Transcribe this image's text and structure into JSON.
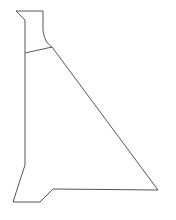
{
  "figure": {
    "background_color": "#ffffff",
    "stroke_color": "#555555",
    "fill_color": "#ffffff",
    "stroke_width": 1,
    "canvas": {
      "width": 176,
      "height": 220
    }
  },
  "geometry": {
    "outline_points": [
      {
        "name": "top-left-chamfer-start",
        "x": 16,
        "y": 11
      },
      {
        "name": "top-right-neck",
        "x": 43,
        "y": 11
      },
      {
        "name": "neck-right-straight-end",
        "x": 43,
        "y": 30
      },
      {
        "name": "shoulder-curve-control",
        "x": 45,
        "y": 41
      },
      {
        "name": "shoulder-junction",
        "x": 52,
        "y": 47
      },
      {
        "name": "bottom-right-vertex",
        "x": 158,
        "y": 190
      },
      {
        "name": "base-step-right",
        "x": 53,
        "y": 189
      },
      {
        "name": "base-step-left",
        "x": 40,
        "y": 202
      },
      {
        "name": "bottom-left-vertex",
        "x": 13,
        "y": 202
      },
      {
        "name": "left-flare-top",
        "x": 25,
        "y": 165
      },
      {
        "name": "left-edge-top",
        "x": 25,
        "y": 20
      }
    ],
    "interior_line": {
      "name": "shoulder-tie-line",
      "from": {
        "x": 25,
        "y": 53
      },
      "to": {
        "x": 52,
        "y": 47
      }
    },
    "outline_path": "M 16 11 L 43 11 L 43 30 C 44 38 46 43 52 47 L 158 190 L 53 189 L 40 202 L 13 202 L 25 165 L 25 20 Z",
    "interior_path": "M 25 53 L 52 47"
  }
}
